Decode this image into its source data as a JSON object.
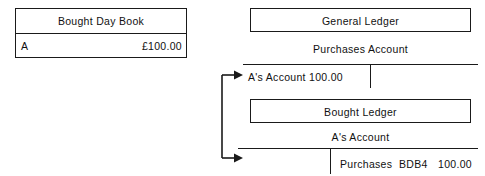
{
  "diagram": {
    "ink_color": "#1a1a1a",
    "background_color": "#ffffff"
  },
  "bought_day_book": {
    "title": "Bought Day Book",
    "row": {
      "name": "A",
      "amount": "£100.00"
    }
  },
  "general_ledger": {
    "title": "General Ledger",
    "account_name": "Purchases Account",
    "debit_entry": "A's Account 100.00"
  },
  "bought_ledger": {
    "title": "Bought Ledger",
    "account_name": "A's Account",
    "credit_entry": {
      "description": "Purchases",
      "reference": "BDB4",
      "amount": "100.00"
    }
  },
  "connector": {
    "name": "posting-connector",
    "arrow_count": 2,
    "targets": [
      "purchases-account-debit-side",
      "as-account-credit-side"
    ]
  }
}
